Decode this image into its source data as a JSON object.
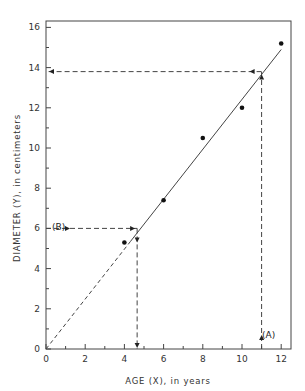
{
  "chart_data": {
    "type": "scatter",
    "title": "",
    "xlabel": "AGE (X), in years",
    "ylabel": "DIAMETER (Y), in centimeters",
    "xlim": [
      0,
      12.5
    ],
    "ylim": [
      0,
      16.4
    ],
    "x_ticks": [
      0,
      2,
      4,
      6,
      8,
      10,
      12
    ],
    "y_ticks": [
      0,
      2,
      4,
      6,
      8,
      10,
      12,
      14,
      16
    ],
    "grid": false,
    "legend": null,
    "series": [
      {
        "name": "observations",
        "type": "scatter",
        "points": [
          {
            "x": 4,
            "y": 5.3
          },
          {
            "x": 6,
            "y": 7.4
          },
          {
            "x": 8,
            "y": 10.5
          },
          {
            "x": 10,
            "y": 12.0
          },
          {
            "x": 12,
            "y": 15.2
          }
        ]
      },
      {
        "name": "fitted line",
        "type": "line",
        "points": [
          {
            "x": 0,
            "y": 0
          },
          {
            "x": 12.0,
            "y": 14.9
          }
        ],
        "dashed_segment": {
          "from_x": 0,
          "to_x": 4.3
        }
      }
    ],
    "annotations": [
      {
        "label": "(A)",
        "description": "Given age X=11, read up to line then left to diameter",
        "x": 11,
        "y_on_line": 13.8
      },
      {
        "label": "(B)",
        "description": "Given diameter Y=6, read right to line then down to age",
        "y": 6,
        "x_on_line": 4.65
      }
    ]
  },
  "labels": {
    "annotation_a": "(A)",
    "annotation_b": "(B)",
    "xlabel": "AGE (X), in years",
    "ylabel": "DIAMETER (Y), in centimeters",
    "origin_y": "0",
    "origin_x": "0"
  }
}
